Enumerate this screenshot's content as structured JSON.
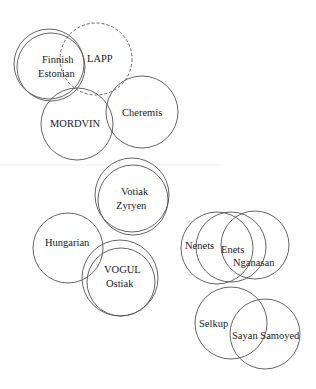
{
  "diagram": {
    "type": "overlapping-circles",
    "stroke_color": "#555555",
    "groups": [
      {
        "id": "finnish",
        "labels": [
          "Finnish",
          "Estonian"
        ],
        "circles": [
          {
            "cx": 49,
            "cy": 64,
            "r": 35,
            "dashed": false
          },
          {
            "cx": 51,
            "cy": 67,
            "r": 34,
            "dashed": false
          }
        ],
        "label_pos": [
          [
            42,
            63
          ],
          [
            38,
            77
          ]
        ]
      },
      {
        "id": "lapp",
        "labels": [
          "LAPP"
        ],
        "circles": [
          {
            "cx": 96,
            "cy": 59,
            "r": 36,
            "dashed": true
          }
        ],
        "label_pos": [
          [
            87,
            62
          ]
        ]
      },
      {
        "id": "mordvin",
        "labels": [
          "MORDVIN"
        ],
        "circles": [
          {
            "cx": 77,
            "cy": 124,
            "r": 36,
            "dashed": false
          }
        ],
        "label_pos": [
          [
            50,
            127
          ]
        ]
      },
      {
        "id": "cheremis",
        "labels": [
          "Cheremis"
        ],
        "circles": [
          {
            "cx": 142,
            "cy": 112,
            "r": 36,
            "dashed": false
          }
        ],
        "label_pos": [
          [
            122,
            116
          ]
        ]
      },
      {
        "id": "votiak",
        "labels": [
          "Votiak",
          "Zyryen"
        ],
        "circles": [
          {
            "cx": 132,
            "cy": 195,
            "r": 37,
            "dashed": false
          },
          {
            "cx": 133,
            "cy": 200,
            "r": 35,
            "dashed": false
          }
        ],
        "label_pos": [
          [
            121,
            195
          ],
          [
            116,
            209
          ]
        ]
      },
      {
        "id": "hungarian",
        "labels": [
          "Hungarian"
        ],
        "circles": [
          {
            "cx": 68,
            "cy": 248,
            "r": 35,
            "dashed": false
          }
        ],
        "label_pos": [
          [
            45,
            246
          ]
        ]
      },
      {
        "id": "vogul",
        "labels": [
          "VOGUL",
          "Ostiak"
        ],
        "circles": [
          {
            "cx": 120,
            "cy": 278,
            "r": 38,
            "dashed": false
          },
          {
            "cx": 121,
            "cy": 282,
            "r": 34,
            "dashed": false
          }
        ],
        "label_pos": [
          [
            104,
            273
          ],
          [
            106,
            287
          ]
        ]
      },
      {
        "id": "nenets",
        "labels": [
          "Nenets"
        ],
        "circles": [
          {
            "cx": 217,
            "cy": 248,
            "r": 36,
            "dashed": false
          }
        ],
        "label_pos": [
          [
            185,
            249
          ]
        ]
      },
      {
        "id": "enets",
        "labels": [
          "Enets"
        ],
        "circles": [
          {
            "cx": 231,
            "cy": 247,
            "r": 35,
            "dashed": false
          }
        ],
        "label_pos": [
          [
            221,
            253
          ]
        ]
      },
      {
        "id": "nganasan",
        "labels": [
          "Nganasan"
        ],
        "circles": [
          {
            "cx": 255,
            "cy": 245,
            "r": 34,
            "dashed": false
          }
        ],
        "label_pos": [
          [
            233,
            266
          ]
        ]
      },
      {
        "id": "selkup",
        "labels": [
          "Selkup"
        ],
        "circles": [
          {
            "cx": 231,
            "cy": 323,
            "r": 36,
            "dashed": false
          }
        ],
        "label_pos": [
          [
            199,
            327
          ]
        ]
      },
      {
        "id": "sayan-samoyed",
        "labels": [
          "Sayan Samoyed"
        ],
        "circles": [
          {
            "cx": 265,
            "cy": 334,
            "r": 35,
            "dashed": false
          }
        ],
        "label_pos": [
          [
            232,
            339
          ]
        ]
      }
    ]
  }
}
